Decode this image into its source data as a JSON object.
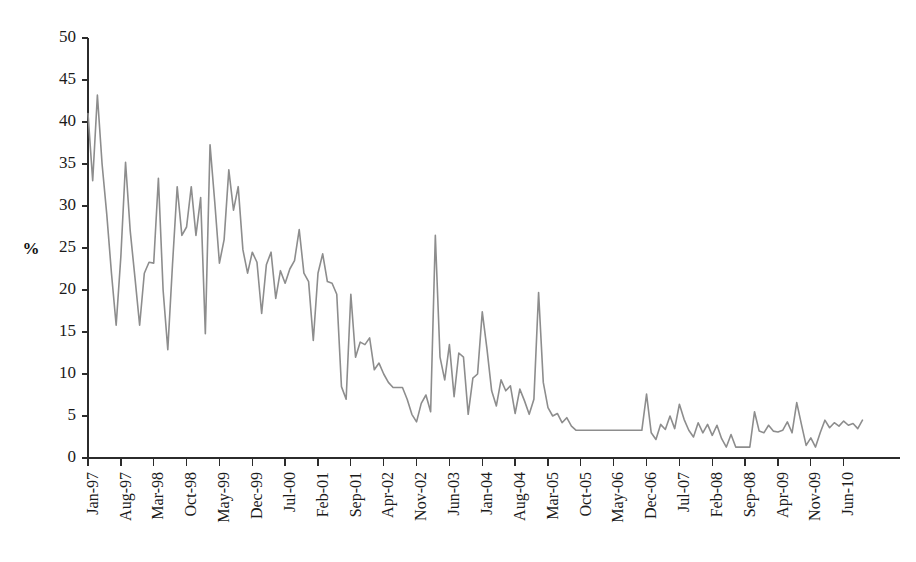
{
  "chart_data": {
    "type": "line",
    "title": "",
    "subtitle": "",
    "xlabel": "",
    "ylabel": "%",
    "ylim": [
      0,
      50
    ],
    "yticks": [
      0,
      5,
      10,
      15,
      20,
      25,
      30,
      35,
      40,
      45,
      50
    ],
    "ytick_labels": [
      "0",
      "5",
      "10",
      "15",
      "20",
      "25",
      "30",
      "35",
      "40",
      "45",
      "50"
    ],
    "grid": false,
    "legend": false,
    "legend_position": "none",
    "line_color": "#8d8d8d",
    "axis_color": "#2b2b2b",
    "tick_interval_months": 7,
    "xtick_labels": [
      "Jan-97",
      "Aug-97",
      "Mar-98",
      "Oct-98",
      "May-99",
      "Dec-99",
      "Jul-00",
      "Feb-01",
      "Sep-01",
      "Apr-02",
      "Nov-02",
      "Jun-03",
      "Jan-04",
      "Aug-04",
      "Mar-05",
      "Oct-05",
      "May-06",
      "Dec-06",
      "Jul-07",
      "Feb-08",
      "Sep-08",
      "Apr-09",
      "Nov-09",
      "Jun-10"
    ],
    "x": [
      "Jan-97",
      "Feb-97",
      "Mar-97",
      "Apr-97",
      "May-97",
      "Jun-97",
      "Jul-97",
      "Aug-97",
      "Sep-97",
      "Oct-97",
      "Nov-97",
      "Dec-97",
      "Jan-98",
      "Feb-98",
      "Mar-98",
      "Apr-98",
      "May-98",
      "Jun-98",
      "Jul-98",
      "Aug-98",
      "Sep-98",
      "Oct-98",
      "Nov-98",
      "Dec-98",
      "Jan-99",
      "Feb-99",
      "Mar-99",
      "Apr-99",
      "May-99",
      "Jun-99",
      "Jul-99",
      "Aug-99",
      "Sep-99",
      "Oct-99",
      "Nov-99",
      "Dec-99",
      "Jan-00",
      "Feb-00",
      "Mar-00",
      "Apr-00",
      "May-00",
      "Jun-00",
      "Jul-00",
      "Aug-00",
      "Sep-00",
      "Oct-00",
      "Nov-00",
      "Dec-00",
      "Jan-01",
      "Feb-01",
      "Mar-01",
      "Apr-01",
      "May-01",
      "Jun-01",
      "Jul-01",
      "Aug-01",
      "Sep-01",
      "Oct-01",
      "Nov-01",
      "Dec-01",
      "Jan-02",
      "Feb-02",
      "Mar-02",
      "Apr-02",
      "May-02",
      "Jun-02",
      "Jul-02",
      "Aug-02",
      "Sep-02",
      "Oct-02",
      "Nov-02",
      "Dec-02",
      "Jan-03",
      "Feb-03",
      "Mar-03",
      "Apr-03",
      "May-03",
      "Jun-03",
      "Jul-03",
      "Aug-03",
      "Sep-03",
      "Oct-03",
      "Nov-03",
      "Dec-03",
      "Jan-04",
      "Feb-04",
      "Mar-04",
      "Apr-04",
      "May-04",
      "Jun-04",
      "Jul-04",
      "Aug-04",
      "Sep-04",
      "Oct-04",
      "Nov-04",
      "Dec-04",
      "Jan-05",
      "Feb-05",
      "Mar-05",
      "Apr-05",
      "May-05",
      "Jun-05",
      "Jul-05",
      "Aug-05",
      "Sep-05",
      "Oct-05",
      "Nov-05",
      "Dec-05",
      "Jan-06",
      "Feb-06",
      "Mar-06",
      "Apr-06",
      "May-06",
      "Jun-06",
      "Jul-06",
      "Aug-06",
      "Sep-06",
      "Oct-06",
      "Nov-06",
      "Dec-06",
      "Jan-07",
      "Feb-07",
      "Mar-07",
      "Apr-07",
      "May-07",
      "Jun-07",
      "Jul-07",
      "Aug-07",
      "Sep-07",
      "Oct-07",
      "Nov-07",
      "Dec-07",
      "Jan-08",
      "Feb-08",
      "Mar-08",
      "Apr-08",
      "May-08",
      "Jun-08",
      "Jul-08",
      "Aug-08",
      "Sep-08",
      "Oct-08",
      "Nov-08",
      "Dec-08",
      "Jan-09",
      "Feb-09",
      "Mar-09",
      "Apr-09",
      "May-09",
      "Jun-09",
      "Jul-09",
      "Aug-09",
      "Sep-09",
      "Oct-09",
      "Nov-09",
      "Dec-09",
      "Jan-10",
      "Feb-10",
      "Mar-10",
      "Apr-10",
      "May-10",
      "Jun-10",
      "Jul-10",
      "Aug-10",
      "Sep-10",
      "Oct-10"
    ],
    "values": [
      41.0,
      33.0,
      43.2,
      35.0,
      29.0,
      22.0,
      15.8,
      24.0,
      35.2,
      27.0,
      21.5,
      15.8,
      22.0,
      23.3,
      23.2,
      33.3,
      20.0,
      12.9,
      23.0,
      32.3,
      26.5,
      27.5,
      32.3,
      26.5,
      31.0,
      14.8,
      37.3,
      30.5,
      23.2,
      26.0,
      34.3,
      29.5,
      32.3,
      24.8,
      22.0,
      24.5,
      23.3,
      17.2,
      23.0,
      24.5,
      19.0,
      22.3,
      20.8,
      22.5,
      23.5,
      27.2,
      22.0,
      21.0,
      14.0,
      22.0,
      24.3,
      21.0,
      20.8,
      19.5,
      8.5,
      7.0,
      19.5,
      12.0,
      13.8,
      13.5,
      14.3,
      10.5,
      11.3,
      10.0,
      9.0,
      8.4,
      8.4,
      8.4,
      7.0,
      5.2,
      4.3,
      6.5,
      7.5,
      5.5,
      26.5,
      12.0,
      9.3,
      13.5,
      7.3,
      12.5,
      12.0,
      5.2,
      9.5,
      10.0,
      17.4,
      13.0,
      8.0,
      6.2,
      9.3,
      8.0,
      8.6,
      5.3,
      8.2,
      6.8,
      5.2,
      7.0,
      19.7,
      9.0,
      6.0,
      5.0,
      5.3,
      4.2,
      4.8,
      3.8,
      3.3,
      3.3,
      3.3,
      3.3,
      3.3,
      3.3,
      3.3,
      3.3,
      3.3,
      3.3,
      3.3,
      3.3,
      3.3,
      3.3,
      3.3,
      7.6,
      3.0,
      2.2,
      4.0,
      3.4,
      5.0,
      3.5,
      6.4,
      4.6,
      3.3,
      2.5,
      4.2,
      3.0,
      4.0,
      2.7,
      3.9,
      2.3,
      1.3,
      2.8,
      1.3,
      1.3,
      1.3,
      1.3,
      5.5,
      3.2,
      3.0,
      3.9,
      3.2,
      3.1,
      3.3,
      4.3,
      3.0,
      6.6,
      4.0,
      1.5,
      2.4,
      1.3,
      3.0,
      4.5,
      3.6,
      4.2,
      3.8,
      4.4,
      3.9,
      4.1,
      3.5,
      4.5
    ]
  },
  "axis": {
    "y_label_text": "%"
  }
}
